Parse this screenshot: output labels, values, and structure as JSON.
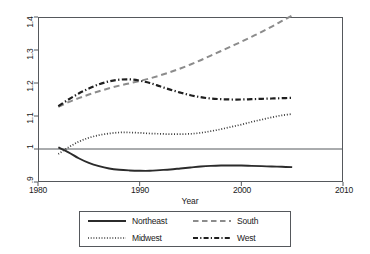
{
  "chart_data": {
    "type": "line",
    "title": "",
    "xlabel": "Year",
    "ylabel": "",
    "xlim": [
      1980,
      2010
    ],
    "ylim": [
      0.9,
      1.4
    ],
    "grid": false,
    "legend_position": "bottom-center",
    "reference_line": {
      "axis": "y",
      "value": 1
    },
    "xticks": [
      1980,
      1990,
      2000,
      2010
    ],
    "xtick_labels": [
      "1980",
      "1990",
      "2000",
      "2010"
    ],
    "yticks": [
      0.9,
      1.0,
      1.1,
      1.2,
      1.3,
      1.4
    ],
    "ytick_labels": [
      ".9",
      "1",
      "1.1",
      "1.2",
      "1.3",
      "1.4"
    ],
    "x": [
      1982,
      1983,
      1984,
      1985,
      1986,
      1987,
      1988,
      1989,
      1990,
      1991,
      1992,
      1993,
      1994,
      1995,
      1996,
      1997,
      1998,
      1999,
      2000,
      2001,
      2002,
      2003,
      2004,
      2005
    ],
    "series": [
      {
        "name": "Northeast",
        "style": "solid",
        "color": "#2b2b2b",
        "values": [
          1.005,
          0.99,
          0.972,
          0.958,
          0.948,
          0.941,
          0.937,
          0.935,
          0.934,
          0.934,
          0.936,
          0.938,
          0.941,
          0.944,
          0.947,
          0.949,
          0.95,
          0.95,
          0.95,
          0.949,
          0.948,
          0.947,
          0.946,
          0.945
        ]
      },
      {
        "name": "South",
        "style": "dashed",
        "color": "#8c8c8c",
        "values": [
          1.128,
          1.142,
          1.154,
          1.165,
          1.175,
          1.184,
          1.192,
          1.199,
          1.206,
          1.214,
          1.223,
          1.233,
          1.244,
          1.256,
          1.269,
          1.283,
          1.297,
          1.311,
          1.325,
          1.34,
          1.355,
          1.371,
          1.388,
          1.405
        ]
      },
      {
        "name": "Midwest",
        "style": "dotted",
        "color": "#3a3a3a",
        "values": [
          0.985,
          1.005,
          1.022,
          1.034,
          1.042,
          1.047,
          1.05,
          1.05,
          1.049,
          1.047,
          1.046,
          1.045,
          1.045,
          1.046,
          1.049,
          1.054,
          1.06,
          1.067,
          1.074,
          1.082,
          1.089,
          1.096,
          1.102,
          1.106
        ]
      },
      {
        "name": "West",
        "style": "dashdot",
        "color": "#1f1f1f",
        "values": [
          1.13,
          1.15,
          1.168,
          1.183,
          1.196,
          1.205,
          1.21,
          1.211,
          1.207,
          1.2,
          1.19,
          1.18,
          1.171,
          1.163,
          1.157,
          1.153,
          1.151,
          1.15,
          1.15,
          1.151,
          1.152,
          1.153,
          1.154,
          1.155
        ]
      }
    ]
  },
  "axes": {
    "x_title": "Year",
    "x_tick_labels": [
      "1980",
      "1990",
      "2000",
      "2010"
    ],
    "y_tick_labels": [
      ".9",
      "1",
      "1.1",
      "1.2",
      "1.3",
      "1.4"
    ]
  },
  "legend": {
    "entries": [
      {
        "label": "Northeast",
        "icon": "solid-line-swatch"
      },
      {
        "label": "South",
        "icon": "dashed-line-swatch"
      },
      {
        "label": "Midwest",
        "icon": "dotted-line-swatch"
      },
      {
        "label": "West",
        "icon": "dashdot-line-swatch"
      }
    ]
  }
}
